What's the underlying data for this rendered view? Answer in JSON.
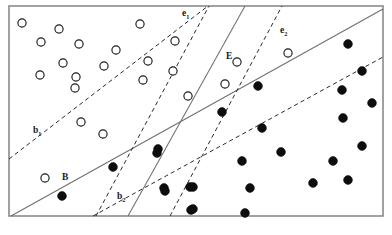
{
  "figure": {
    "caption": "",
    "width": 392,
    "height": 235,
    "frame": {
      "x": 9,
      "y": 6,
      "width": 374,
      "height": 210
    }
  },
  "labels": {
    "b1": {
      "text": "b",
      "sub": "1",
      "x": 33,
      "y": 133
    },
    "b2": {
      "text": "b",
      "sub": "2",
      "x": 117,
      "y": 199
    },
    "e1": {
      "text": "e",
      "sub": "1",
      "x": 182,
      "y": 16
    },
    "e2": {
      "text": "e",
      "sub": "2",
      "x": 280,
      "y": 33
    },
    "B": {
      "text": "B",
      "x": 62,
      "y": 180
    },
    "E": {
      "text": "E",
      "x": 226,
      "y": 59
    }
  },
  "colors": {
    "frame_stroke": "#8a8a8a",
    "solid_line": "#6f6f6f",
    "dashed_line": "#2a2a2a",
    "open_marker_stroke": "#1a1a1a",
    "open_marker_fill": "#ffffff",
    "filled_marker": "#0d0d0d",
    "background": "#ffffff"
  },
  "chart_data": {
    "type": "scatter",
    "title": "",
    "xlabel": "",
    "ylabel": "",
    "xlim": [
      9,
      383
    ],
    "ylim": [
      6,
      216
    ],
    "grid": false,
    "legend": "none",
    "series": [
      {
        "name": "class-open",
        "marker": "open-circle",
        "radius": 4.1,
        "points": [
          [
            22,
            23
          ],
          [
            59,
            29
          ],
          [
            41,
            42
          ],
          [
            79,
            44
          ],
          [
            116,
            50
          ],
          [
            140,
            24
          ],
          [
            175,
            41
          ],
          [
            63,
            63
          ],
          [
            104,
            66
          ],
          [
            148,
            61
          ],
          [
            40,
            75
          ],
          [
            76,
            77
          ],
          [
            143,
            80
          ],
          [
            173,
            71
          ],
          [
            75,
            88
          ],
          [
            81,
            122
          ],
          [
            103,
            134
          ],
          [
            45,
            178
          ],
          [
            188,
            96
          ],
          [
            237,
            62
          ],
          [
            288,
            53
          ],
          [
            225,
            84
          ]
        ]
      },
      {
        "name": "class-filled",
        "marker": "filled-circle",
        "radius": 4.4,
        "points": [
          [
            113,
            167
          ],
          [
            158,
            149
          ],
          [
            62,
            196
          ],
          [
            164,
            188
          ],
          [
            348,
            44
          ],
          [
            258,
            86
          ],
          [
            362,
            71
          ],
          [
            342,
            90
          ],
          [
            372,
            103
          ],
          [
            222,
            112
          ],
          [
            343,
            118
          ],
          [
            262,
            128
          ],
          [
            242,
            161
          ],
          [
            281,
            152
          ],
          [
            333,
            161
          ],
          [
            362,
            146
          ],
          [
            250,
            188
          ],
          [
            313,
            183
          ],
          [
            348,
            180
          ],
          [
            245,
            213
          ],
          [
            193,
            187
          ],
          [
            193,
            209
          ],
          [
            157,
            153
          ],
          [
            165,
            191
          ],
          [
            190,
            187
          ],
          [
            191,
            210
          ]
        ]
      }
    ],
    "lines": [
      {
        "name": "B",
        "style": "solid",
        "x1": 11,
        "y1": 216,
        "x2": 383,
        "y2": 9
      },
      {
        "name": "B-upper",
        "style": "solid",
        "x1": 245,
        "y1": 6,
        "x2": 128,
        "y2": 216
      },
      {
        "name": "b1",
        "style": "dashed",
        "x1": 9,
        "y1": 159,
        "x2": 208,
        "y2": 6
      },
      {
        "name": "b2",
        "style": "dashed",
        "x1": 93,
        "y1": 216,
        "x2": 383,
        "y2": 57
      },
      {
        "name": "e1",
        "style": "dashed",
        "x1": 96,
        "y1": 216,
        "x2": 209,
        "y2": 6
      },
      {
        "name": "e2",
        "style": "dashed",
        "x1": 170,
        "y1": 216,
        "x2": 282,
        "y2": 6
      }
    ]
  }
}
